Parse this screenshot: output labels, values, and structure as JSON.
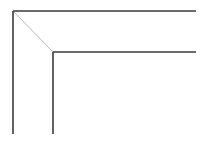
{
  "canvas": {
    "width": 208,
    "height": 142,
    "background_color": "#ffffff",
    "title": "Picture frame corner line drawing"
  },
  "drawing": {
    "type": "line-art",
    "subject": "mitered frame corner (top-left)",
    "stroke_color_outer": "#3a3a3c",
    "stroke_color_inner": "#3a3a3c",
    "stroke_color_miter": "#b9b9bd",
    "stroke_width_outer": 1.6,
    "stroke_width_inner": 1.6,
    "stroke_width_miter": 1.0,
    "outer_corner": {
      "x": 13,
      "y": 11
    },
    "inner_corner": {
      "x": 53,
      "y": 52
    },
    "frame_band_width": 41,
    "segments": [
      {
        "name": "outer-top-edge",
        "label": "Outer top edge",
        "x1": 13,
        "y1": 11,
        "x2": 196,
        "y2": 11,
        "color": "#3a3a3c",
        "width": 1.6
      },
      {
        "name": "outer-left-edge",
        "label": "Outer left edge",
        "x1": 13,
        "y1": 11,
        "x2": 13,
        "y2": 134,
        "color": "#3a3a3c",
        "width": 1.6
      },
      {
        "name": "inner-top-edge",
        "label": "Inner top edge",
        "x1": 53,
        "y1": 52,
        "x2": 196,
        "y2": 52,
        "color": "#3a3a3c",
        "width": 1.6
      },
      {
        "name": "inner-left-edge",
        "label": "Inner left edge",
        "x1": 53,
        "y1": 52,
        "x2": 53,
        "y2": 134,
        "color": "#3a3a3c",
        "width": 1.6
      },
      {
        "name": "miter-diagonal",
        "label": "45 degree miter joint",
        "x1": 13,
        "y1": 11,
        "x2": 53,
        "y2": 52,
        "color": "#b9b9bd",
        "width": 1.0
      }
    ]
  }
}
